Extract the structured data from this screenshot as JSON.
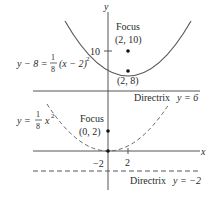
{
  "figure": {
    "axes": {
      "x_label": "x",
      "y_label": "y",
      "x_tick": "2",
      "y_tick_top": "10",
      "y_tick_bottom": "−2"
    },
    "upper_parabola": {
      "equation_lhs": "y − 8 =",
      "fraction_num": "1",
      "fraction_den": "8",
      "equation_rhs": "(x − 2)",
      "exponent": "2",
      "style": "solid",
      "focus_label": "Focus",
      "focus_coords": "(2, 10)",
      "vertex_coords": "(2, 8)",
      "directrix_label": "Directrix",
      "directrix_eq": "y = 6"
    },
    "lower_parabola": {
      "equation_lhs": "y =",
      "fraction_num": "1",
      "fraction_den": "8",
      "equation_rhs": "x",
      "exponent": "2",
      "style": "dashed",
      "focus_label": "Focus",
      "focus_coords": "(0, 2)",
      "directrix_label": "Directrix",
      "directrix_eq": "y = −2"
    },
    "colors": {
      "curve": "#555555",
      "axis": "#555555",
      "text": "#2a2a2a",
      "point": "#111111"
    }
  }
}
